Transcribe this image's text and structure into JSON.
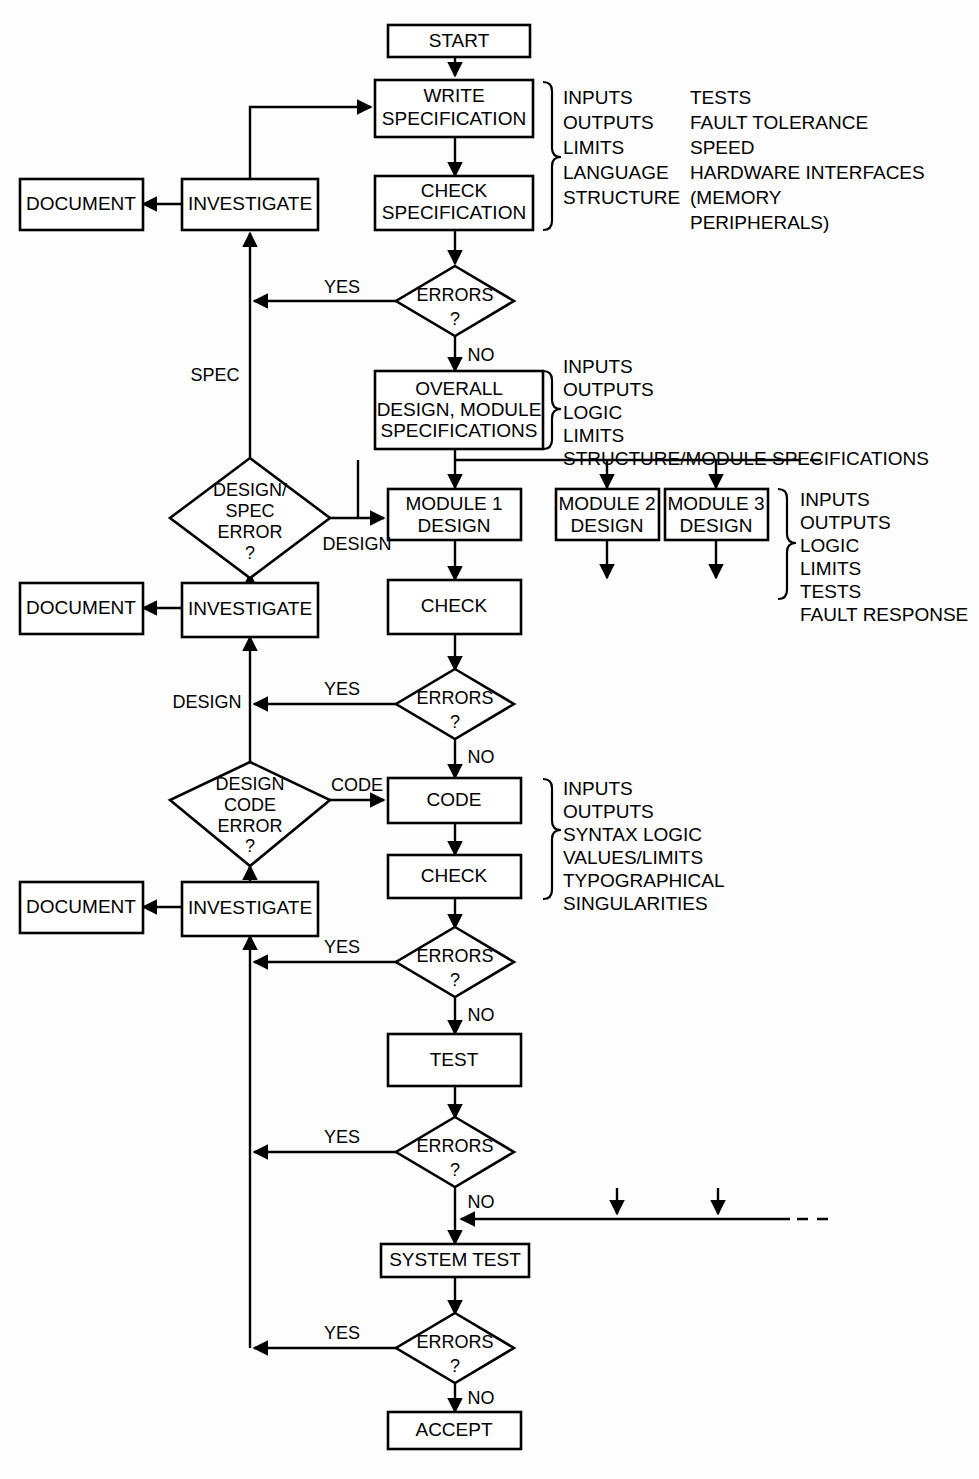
{
  "diagram": {
    "nodes": {
      "start": "START",
      "write_specification_l1": "WRITE",
      "write_specification_l2": "SPECIFICATION",
      "check_specification_l1": "CHECK",
      "check_specification_l2": "SPECIFICATION",
      "document_1": "DOCUMENT",
      "document_2": "DOCUMENT",
      "document_3": "DOCUMENT",
      "investigate_1": "INVESTIGATE",
      "investigate_2": "INVESTIGATE",
      "investigate_3": "INVESTIGATE",
      "overall_design_l1": "OVERALL",
      "overall_design_l2": "DESIGN, MODULE",
      "overall_design_l3": "SPECIFICATIONS",
      "module1_l1": "MODULE 1",
      "module1_l2": "DESIGN",
      "module2_l1": "MODULE 2",
      "module2_l2": "DESIGN",
      "module3_l1": "MODULE 3",
      "module3_l2": "DESIGN",
      "check_module": "CHECK",
      "code": "CODE",
      "check_code": "CHECK",
      "test": "TEST",
      "system_test": "SYSTEM TEST",
      "accept": "ACCEPT"
    },
    "decisions": {
      "errors_spec_l1": "ERRORS",
      "errors_spec_l2": "?",
      "design_spec_error_l1": "DESIGN/",
      "design_spec_error_l2": "SPEC",
      "design_spec_error_l3": "ERROR",
      "design_spec_error_l4": "?",
      "errors_module_l1": "ERRORS",
      "errors_module_l2": "?",
      "design_code_error_l1": "DESIGN",
      "design_code_error_l2": "CODE",
      "design_code_error_l3": "ERROR",
      "design_code_error_l4": "?",
      "errors_code_l1": "ERRORS",
      "errors_code_l2": "?",
      "errors_test_l1": "ERRORS",
      "errors_test_l2": "?",
      "errors_systest_l1": "ERRORS",
      "errors_systest_l2": "?"
    },
    "edge_labels": {
      "yes_spec": "YES",
      "no_spec": "NO",
      "spec_branch": "SPEC",
      "design_branch": "DESIGN",
      "yes_module": "YES",
      "design_to_investigate": "DESIGN",
      "no_module": "NO",
      "code_branch": "CODE",
      "yes_code": "YES",
      "no_code": "NO",
      "yes_test": "YES",
      "no_test": "NO",
      "yes_systest": "YES",
      "no_systest": "NO"
    },
    "annotations": {
      "spec_list_col1": [
        "INPUTS",
        "OUTPUTS",
        "LIMITS",
        "LANGUAGE",
        "STRUCTURE"
      ],
      "spec_list_col2": [
        "TESTS",
        "FAULT TOLERANCE",
        "SPEED",
        "HARDWARE INTERFACES",
        "(MEMORY",
        "PERIPHERALS)"
      ],
      "overall_design_list": [
        "INPUTS",
        "OUTPUTS",
        "LOGIC",
        "LIMITS",
        "STRUCTURE/MODULE SPECIFICATIONS"
      ],
      "module_list": [
        "INPUTS",
        "OUTPUTS",
        "LOGIC",
        "LIMITS",
        "TESTS",
        "FAULT RESPONSE"
      ],
      "code_list": [
        "INPUTS",
        "OUTPUTS",
        "SYNTAX LOGIC",
        "VALUES/LIMITS",
        "TYPOGRAPHICAL",
        "SINGULARITIES"
      ]
    },
    "colors": {
      "stroke": "#000000",
      "fill": "#ffffff",
      "background": "#fdfdfd"
    }
  }
}
